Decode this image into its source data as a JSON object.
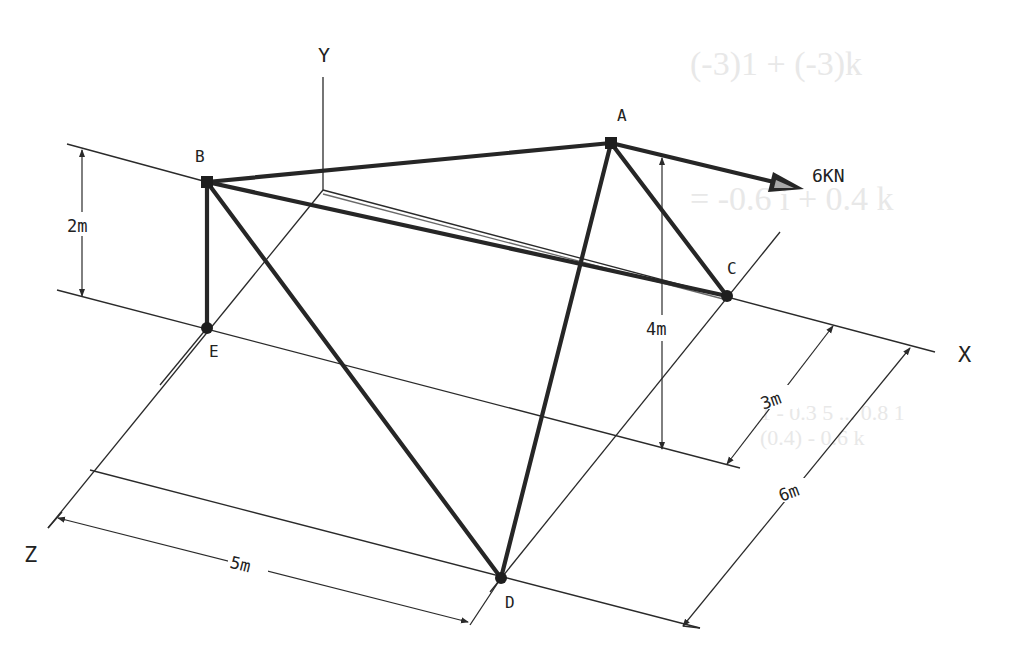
{
  "diagram": {
    "type": "3D space truss",
    "axes": {
      "x_label": "X",
      "y_label": "Y",
      "z_label": "Z"
    },
    "joints": {
      "A": "A",
      "B": "B",
      "C": "C",
      "D": "D",
      "E": "E"
    },
    "members": [
      "AB",
      "AC",
      "AD",
      "BC",
      "BD",
      "BE"
    ],
    "load": {
      "label": "6KN",
      "joint": "A",
      "direction": "+X"
    },
    "dimensions": {
      "BE_height": "2m",
      "A_height": "4m",
      "C_offset_z": "3m",
      "D_offset_z": "6m",
      "D_offset_x": "5m"
    },
    "colors": {
      "ink": "#262626",
      "background": "#ffffff"
    }
  }
}
